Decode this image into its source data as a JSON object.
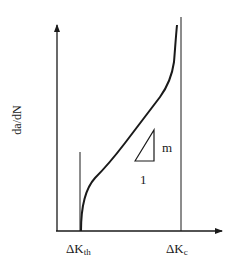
{
  "diagram": {
    "y_axis_label": "da/dN",
    "x_ticks": [
      {
        "main": "ΔK",
        "sub": "th"
      },
      {
        "main": "ΔK",
        "sub": "c"
      }
    ],
    "slope_triangle": {
      "rise_label": "m",
      "run_label": "1"
    },
    "colors": {
      "line": "#1a1a1a",
      "background": "#ffffff"
    }
  }
}
